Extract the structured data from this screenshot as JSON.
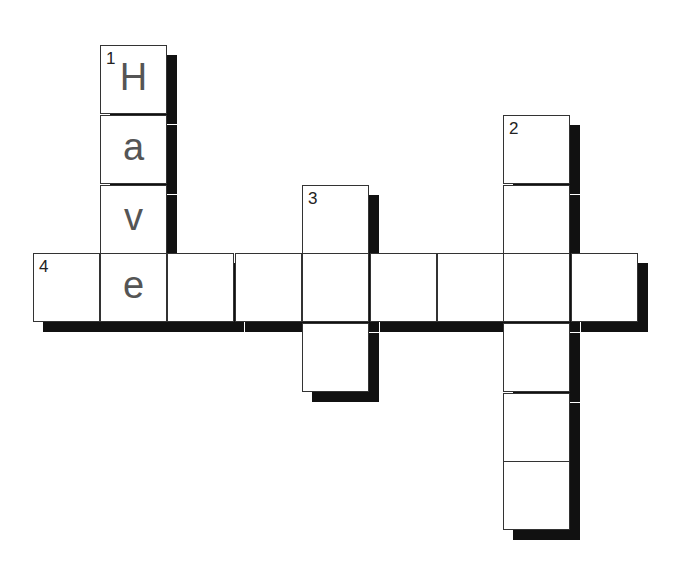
{
  "puzzle": {
    "cell_size": 68,
    "words": [
      {
        "number": "1",
        "direction": "down",
        "col": 1,
        "row": 0,
        "length": 4,
        "letters": [
          "H",
          "a",
          "v",
          "e"
        ]
      },
      {
        "number": "2",
        "direction": "down",
        "col": 7,
        "row": 1,
        "length": 6,
        "letters": [
          "",
          "",
          "",
          "",
          "",
          ""
        ]
      },
      {
        "number": "3",
        "direction": "down",
        "col": 4,
        "row": 2,
        "length": 3,
        "letters": [
          "",
          "",
          ""
        ]
      },
      {
        "number": "4",
        "direction": "across",
        "col": 0,
        "row": 3,
        "length": 9,
        "letters": [
          "",
          "e",
          "",
          "",
          "",
          "",
          "",
          "",
          ""
        ]
      }
    ]
  }
}
